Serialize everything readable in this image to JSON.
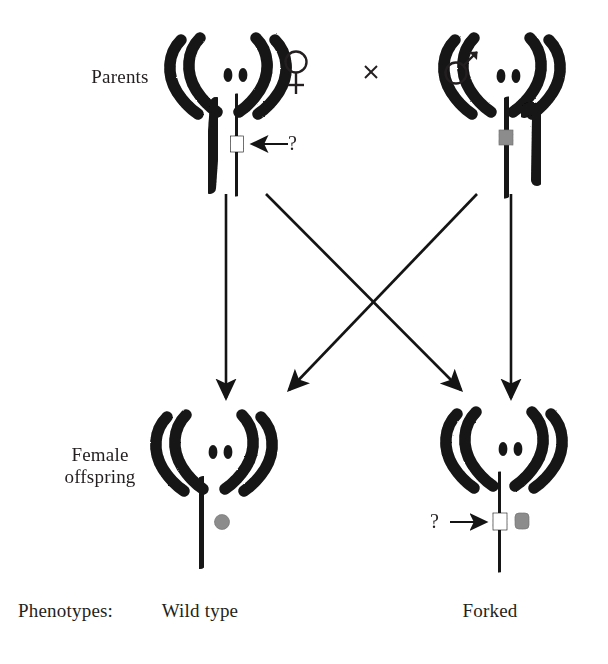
{
  "figure": {
    "background_color": "#ffffff",
    "ink_color": "#141414",
    "band_gray_color": "#8c8c8c",
    "band_white_color": "#ffffff"
  },
  "labels": {
    "parents": "Parents",
    "female_offspring": "Female\noffspring",
    "phenotypes": "Phenotypes:",
    "wild_type": "Wild type",
    "forked": "Forked"
  },
  "symbols": {
    "female": "♀",
    "male": "♂",
    "cross": "×",
    "question": "?"
  },
  "parents": [
    {
      "id": "female-parent",
      "sex_symbol": "♀",
      "sex": "female",
      "center_x": 237,
      "autosome_pairs": 2,
      "dots": 2,
      "sex_chromosomes": [
        {
          "type": "X",
          "side": "left",
          "band": "none"
        },
        {
          "type": "X",
          "side": "right",
          "band": "white",
          "band_label": "?"
        }
      ],
      "annotation": {
        "text": "?",
        "arrow": "left"
      }
    },
    {
      "id": "male-parent",
      "sex_symbol": "♂",
      "sex": "male",
      "center_x": 510,
      "autosome_pairs": 2,
      "dots": 2,
      "sex_chromosomes": [
        {
          "type": "X",
          "side": "left",
          "band": "gray"
        },
        {
          "type": "Y",
          "side": "right",
          "band": "none"
        }
      ],
      "annotation": null
    }
  ],
  "offspring": [
    {
      "id": "wild-type-offspring",
      "phenotype": "Wild type",
      "center_x": 222,
      "autosome_pairs": 2,
      "dots": 2,
      "sex_chromosomes": [
        {
          "type": "X",
          "side": "left",
          "band": "none"
        },
        {
          "type": "X",
          "side": "right",
          "band": "gray"
        }
      ],
      "annotation": null
    },
    {
      "id": "forked-offspring",
      "phenotype": "Forked",
      "center_x": 512,
      "autosome_pairs": 2,
      "dots": 2,
      "sex_chromosomes": [
        {
          "type": "X",
          "side": "left",
          "band": "white",
          "band_label": "?"
        },
        {
          "type": "X",
          "side": "right",
          "band": "gray"
        }
      ],
      "annotation": {
        "text": "?",
        "arrow": "right"
      }
    }
  ],
  "arrows": [
    {
      "id": "arrow-female-to-wildtype",
      "from": "female-parent",
      "to": "wild-type-offspring",
      "kind": "vertical",
      "x1": 226,
      "y1": 192,
      "x2": 226,
      "y2": 400
    },
    {
      "id": "arrow-female-to-forked",
      "from": "female-parent",
      "to": "forked-offspring",
      "kind": "diagonal",
      "x1": 266,
      "y1": 192,
      "x2": 463,
      "y2": 392
    },
    {
      "id": "arrow-male-to-wildtype",
      "from": "male-parent",
      "to": "wild-type-offspring",
      "kind": "diagonal",
      "x1": 476,
      "y1": 192,
      "x2": 288,
      "y2": 392
    },
    {
      "id": "arrow-male-to-forked",
      "from": "male-parent",
      "to": "forked-offspring",
      "kind": "vertical",
      "x1": 511,
      "y1": 192,
      "x2": 511,
      "y2": 400
    }
  ],
  "cross_marker": {
    "symbol": "×",
    "x": 371,
    "y": 72
  }
}
